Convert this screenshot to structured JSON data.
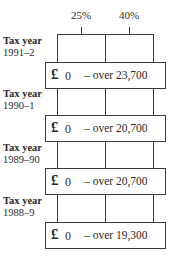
{
  "header": {
    "rates": [
      {
        "label": "25%",
        "x": 81
      },
      {
        "label": "40%",
        "x": 129
      }
    ]
  },
  "rows": [
    {
      "title": "Tax year",
      "year": "1991–2",
      "currency": "£",
      "from": "0",
      "range": "– over 23,700"
    },
    {
      "title": "Tax year",
      "year": "1990–1",
      "currency": "£",
      "from": "0",
      "range": "– over 20,700"
    },
    {
      "title": "Tax year",
      "year": "1989–90",
      "currency": "£",
      "from": "0",
      "range": "– over 20,700"
    },
    {
      "title": "Tax year",
      "year": "1988–9",
      "currency": "£",
      "from": "0",
      "range": "– over 19,300"
    }
  ],
  "colors": {
    "line": "#3a3a3a",
    "text": "#2a2a2a",
    "background": "#ffffff"
  }
}
